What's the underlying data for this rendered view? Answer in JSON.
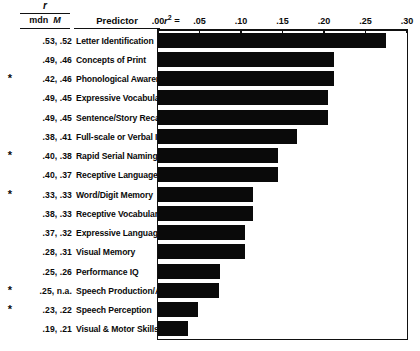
{
  "header": {
    "r_italic": "r",
    "mdn_M": "mdn  M",
    "mdn_label": "mdn",
    "M_label": "M",
    "predictor_label": "Predictor",
    "r2_label": "r",
    "r2_sup": "2",
    "r2_eq": "="
  },
  "chart_data": {
    "type": "bar",
    "orientation": "horizontal",
    "title": "",
    "xlabel": "r²",
    "ylabel": "Predictor",
    "xlim": [
      0.0,
      0.3
    ],
    "grid": false,
    "legend": null,
    "tick_labels": [
      ".00",
      ".05",
      ".10",
      ".15",
      ".20",
      ".25",
      ".30"
    ],
    "tick_values": [
      0.0,
      0.05,
      0.1,
      0.15,
      0.2,
      0.25,
      0.3
    ],
    "categories": [
      "Letter Identification",
      "Concepts of Print",
      "Phonological Awareness",
      "Expressive Vocabulary",
      "Sentence/Story Recall",
      "Full-scale or Verbal IQ",
      "Rapid Serial Naming",
      "Receptive Language",
      "Word/Digit Memory",
      "Receptive Vocabulary",
      "Expressive Language",
      "Visual Memory",
      "Performance IQ",
      "Speech Production/Artic.",
      "Speech Perception",
      "Visual & Motor Skills"
    ],
    "values": [
      0.275,
      0.212,
      0.212,
      0.205,
      0.205,
      0.168,
      0.145,
      0.145,
      0.115,
      0.115,
      0.105,
      0.105,
      0.075,
      0.073,
      0.048,
      0.036
    ],
    "note": "Rows 1 and 2 of the table share category list ordering with the rows array below."
  },
  "rows": [
    {
      "star": "",
      "mdn": ".53",
      "m": ".52",
      "vals": ".53, .52",
      "predictor": "Letter Identification",
      "r2": 0.275
    },
    {
      "star": "",
      "mdn": ".49",
      "m": ".46",
      "vals": ".49, .46",
      "predictor": "Concepts of Print",
      "r2": 0.212
    },
    {
      "star": "*",
      "mdn": ".42",
      "m": ".46",
      "vals": ".42, .46",
      "predictor": "Phonological Awareness",
      "r2": 0.212
    },
    {
      "star": "",
      "mdn": ".49",
      "m": ".45",
      "vals": ".49, .45",
      "predictor": "Expressive Vocabulary",
      "r2": 0.205
    },
    {
      "star": "",
      "mdn": ".49",
      "m": ".45",
      "vals": ".49, .45",
      "predictor": "Sentence/Story Recall",
      "r2": 0.205
    },
    {
      "star": "",
      "mdn": ".38",
      "m": ".41",
      "vals": ".38, .41",
      "predictor": "Full-scale or Verbal IQ",
      "r2": 0.168
    },
    {
      "star": "*",
      "mdn": ".40",
      "m": ".38",
      "vals": ".40, .38",
      "predictor": "Rapid Serial Naming",
      "r2": 0.145
    },
    {
      "star": "",
      "mdn": ".40",
      "m": ".37",
      "vals": ".40, .37",
      "predictor": "Receptive Language",
      "r2": 0.145
    },
    {
      "star": "*",
      "mdn": ".33",
      "m": ".33",
      "vals": ".33, .33",
      "predictor": "Word/Digit Memory",
      "r2": 0.115
    },
    {
      "star": "",
      "mdn": ".38",
      "m": ".33",
      "vals": ".38, .33",
      "predictor": "Receptive Vocabulary",
      "r2": 0.115
    },
    {
      "star": "",
      "mdn": ".37",
      "m": ".32",
      "vals": ".37, .32",
      "predictor": "Expressive Language",
      "r2": 0.105
    },
    {
      "star": "",
      "mdn": ".28",
      "m": ".31",
      "vals": ".28, .31",
      "predictor": "Visual Memory",
      "r2": 0.105
    },
    {
      "star": "",
      "mdn": ".25",
      "m": ".26",
      "vals": ".25, .26",
      "predictor": "Performance IQ",
      "r2": 0.075
    },
    {
      "star": "*",
      "mdn": ".25",
      "m": "n.a.",
      "vals": ".25, n.a.",
      "predictor": "Speech Production/Artic.",
      "r2": 0.073
    },
    {
      "star": "*",
      "mdn": ".23",
      "m": ".22",
      "vals": ".23, .22",
      "predictor": "Speech Perception",
      "r2": 0.048
    },
    {
      "star": "",
      "mdn": ".19",
      "m": ".21",
      "vals": ".19, .21",
      "predictor": "Visual & Motor Skills",
      "r2": 0.036
    }
  ],
  "colors": {
    "bar": "#0a0a0a",
    "text": "#0a0a0a",
    "background": "#ffffff",
    "rule": "#111111"
  }
}
